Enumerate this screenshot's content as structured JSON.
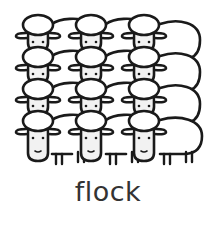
{
  "illustration": {
    "subject": "flock of sheep",
    "rows": 4,
    "columns": 3,
    "stroke_color": "#1a1a1a",
    "fill_color": "#ffffff",
    "face_color": "#f2f2f2"
  },
  "caption": {
    "text": "flock",
    "color": "#333333"
  }
}
